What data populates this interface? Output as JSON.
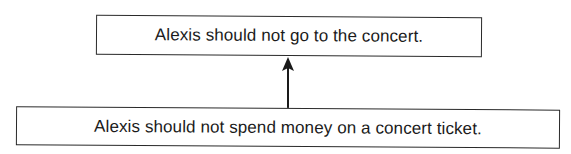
{
  "diagram": {
    "type": "argument-map",
    "nodes": [
      {
        "id": "conclusion",
        "label": "Alexis should not go to the concert."
      },
      {
        "id": "premise",
        "label": "Alexis should not spend money on a concert ticket."
      }
    ],
    "edges": [
      {
        "from": "premise",
        "to": "conclusion",
        "style": "solid-arrow"
      }
    ],
    "colors": {
      "stroke": "#2a2a2a",
      "text": "#1a1a1a",
      "background": "#ffffff"
    }
  }
}
